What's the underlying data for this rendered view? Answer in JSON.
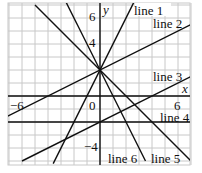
{
  "chart_data": {
    "type": "line",
    "title": "",
    "xlabel": "x",
    "ylabel": "y",
    "xlim": [
      -7,
      7
    ],
    "ylim": [
      -5.3,
      7.2
    ],
    "grid": true,
    "tick_labels": {
      "x": [
        "-6",
        "0",
        "6"
      ],
      "y": [
        "6",
        "4",
        "-4"
      ]
    },
    "series": [
      {
        "name": "line 1",
        "equation": "y = 2x + 2",
        "slope": 2,
        "intercept": 2
      },
      {
        "name": "line 2",
        "equation": "y = 0.5x + 2",
        "slope": 0.5,
        "intercept": 2
      },
      {
        "name": "line 3",
        "equation": "y = 0.5x - 2",
        "slope": 0.5,
        "intercept": -2
      },
      {
        "name": "line 4",
        "equation": "y = -2",
        "slope": 0,
        "intercept": -2
      },
      {
        "name": "line 5",
        "equation": "y = -x + 2",
        "slope": -1,
        "intercept": 2
      },
      {
        "name": "line 6",
        "equation": "y = -2x + 2",
        "slope": -2,
        "intercept": 2
      }
    ]
  },
  "labels": {
    "x_axis": "x",
    "y_axis": "y",
    "tick_neg6": "−6",
    "tick_0": "0",
    "tick_6": "6",
    "tick_y6": "6",
    "tick_y4": "4",
    "tick_yneg4": "−4",
    "line1": "line 1",
    "line2": "line 2",
    "line3": "line 3",
    "line4": "line 4",
    "line5": "line 5",
    "line6": "line 6"
  }
}
